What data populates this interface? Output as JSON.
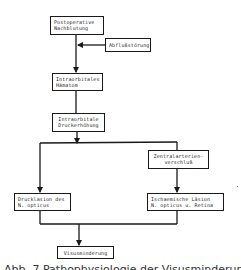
{
  "diagram": {
    "nodes": [
      {
        "id": "n1",
        "label": "Postoperative\nNachblutung"
      },
      {
        "id": "n2",
        "label": "Abflußstörung"
      },
      {
        "id": "n3",
        "label": "Intraorbitales\nHämatom"
      },
      {
        "id": "n4",
        "label": "Intraorbitale\nDruckerhöhung"
      },
      {
        "id": "n5",
        "label": "Zentralarterien-\nverschluß"
      },
      {
        "id": "n6",
        "label": "Drucklasion des\nN. opticus"
      },
      {
        "id": "n7",
        "label": "Ischaemische Läsion\nN. opticus u. Retina"
      },
      {
        "id": "n8",
        "label": "Visusminderung"
      }
    ],
    "edges": [
      {
        "from": "n1",
        "to": "n3"
      },
      {
        "from": "n2",
        "to": "n1-n3 line"
      },
      {
        "from": "n3",
        "to": "n4"
      },
      {
        "from": "n4",
        "to": "n6"
      },
      {
        "from": "n4",
        "to": "n5"
      },
      {
        "from": "n5",
        "to": "n7"
      },
      {
        "from": "n6",
        "to": "n8"
      },
      {
        "from": "n7",
        "to": "n8"
      }
    ],
    "caption": "Abb. 7 Pathophysiologie der Visusminderung"
  },
  "colors": {
    "line": "#1a1a1a",
    "text": "#2a2a2a",
    "background": "#ffffff"
  }
}
